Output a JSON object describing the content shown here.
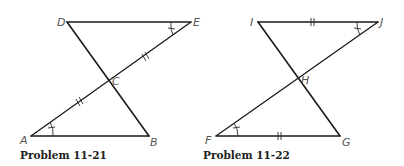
{
  "figures": [
    {
      "caption": "Problem 11-21",
      "points": {
        "D": {
          "label": "D",
          "x": 67,
          "y": 22
        },
        "E": {
          "label": "E",
          "x": 191,
          "y": 22
        },
        "C": {
          "label": "C",
          "x": 110,
          "y": 82
        },
        "A": {
          "label": "A",
          "x": 31,
          "y": 136
        },
        "B": {
          "label": "B",
          "x": 149,
          "y": 136
        }
      },
      "segments": [
        "DE",
        "DB",
        "AE",
        "AB"
      ],
      "congruent_segments": [
        "AC",
        "CE"
      ],
      "congruent_angles": [
        "A",
        "E"
      ]
    },
    {
      "caption": "Problem 11-22",
      "points": {
        "I": {
          "label": "I",
          "x": 258,
          "y": 22
        },
        "J": {
          "label": "J",
          "x": 378,
          "y": 22
        },
        "H": {
          "label": "H",
          "x": 298,
          "y": 79
        },
        "F": {
          "label": "F",
          "x": 216,
          "y": 136
        },
        "G": {
          "label": "G",
          "x": 340,
          "y": 136
        }
      },
      "segments": [
        "IJ",
        "IG",
        "FJ",
        "FG"
      ],
      "congruent_segments": [
        "IJ",
        "FG"
      ],
      "congruent_angles": [
        "F",
        "J"
      ]
    }
  ]
}
